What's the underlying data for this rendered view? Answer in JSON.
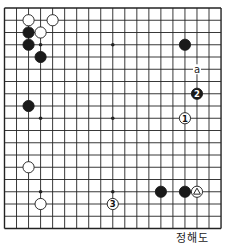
{
  "diagram": {
    "type": "go-board",
    "size": 19,
    "caption": "정해도",
    "colors": {
      "line": "#222222",
      "black": "#1a1a1a",
      "white": "#ffffff"
    },
    "star_points": [
      [
        3,
        3
      ],
      [
        9,
        3
      ],
      [
        15,
        3
      ],
      [
        3,
        9
      ],
      [
        9,
        9
      ],
      [
        15,
        9
      ],
      [
        3,
        15
      ],
      [
        9,
        15
      ],
      [
        15,
        15
      ]
    ],
    "stones": [
      {
        "color": "white",
        "col": 2,
        "row": 1
      },
      {
        "color": "white",
        "col": 4,
        "row": 1
      },
      {
        "color": "black",
        "col": 2,
        "row": 2
      },
      {
        "color": "white",
        "col": 3,
        "row": 2
      },
      {
        "color": "black",
        "col": 2,
        "row": 3
      },
      {
        "color": "black",
        "col": 3,
        "row": 4
      },
      {
        "color": "black",
        "col": 15,
        "row": 3
      },
      {
        "color": "black",
        "col": 16,
        "row": 7,
        "label": "2"
      },
      {
        "color": "white",
        "col": 15,
        "row": 9,
        "label": "1"
      },
      {
        "color": "black",
        "col": 2,
        "row": 8
      },
      {
        "color": "white",
        "col": 2,
        "row": 13
      },
      {
        "color": "white",
        "col": 16,
        "row": 15,
        "mark": "triangle"
      },
      {
        "color": "black",
        "col": 13,
        "row": 15
      },
      {
        "color": "black",
        "col": 15,
        "row": 15
      },
      {
        "color": "white",
        "col": 3,
        "row": 16
      },
      {
        "color": "white",
        "col": 9,
        "row": 16,
        "label": "3"
      }
    ],
    "letters": [
      {
        "text": "a",
        "col": 16,
        "row": 5
      }
    ]
  }
}
